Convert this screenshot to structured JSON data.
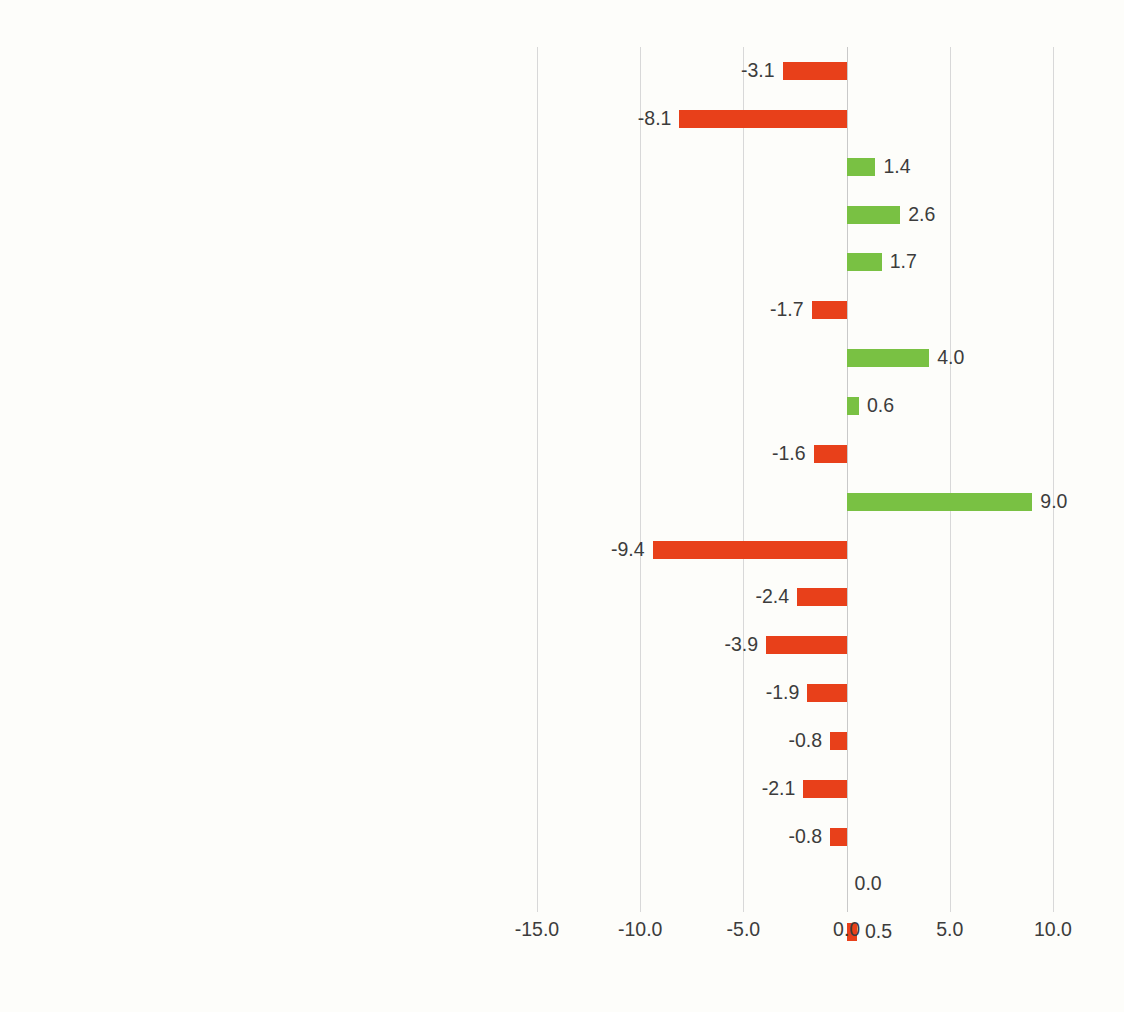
{
  "chart_data": {
    "type": "bar",
    "orientation": "horizontal",
    "title": "",
    "xlabel": "",
    "ylabel": "",
    "xlim": [
      -15.0,
      10.0
    ],
    "xticks": [
      "-15.0",
      "-10.0",
      "-5.0",
      "0.0",
      "5.0",
      "10.0"
    ],
    "xtick_values": [
      -15.0,
      -10.0,
      -5.0,
      0.0,
      5.0,
      10.0
    ],
    "grid": true,
    "legend": "none",
    "colors": {
      "positive": "#79c143",
      "negative": "#e8401a",
      "gridline": "#d8d8d8",
      "text": "#3c3c3c",
      "background": "#fdfdfa"
    },
    "categories": [
      "Other service activities",
      "Arts, entertainment and recreation",
      "Health and social work",
      "Education",
      "Public administration",
      "Administrative and support service activities",
      "Professional, scientific and technical activities",
      "Real estate activities",
      "Financial and insurance",
      "Information and communication",
      "Accommodation and food",
      "Transportation and storage",
      "Wholesale and retail",
      "Construction",
      "Water supply, seweragea and waste",
      "Electricity, gas, steam and air conditioning supply",
      "Manufacturing",
      "Mining and quarrying",
      "Agriculture"
    ],
    "values": [
      -3.1,
      -8.1,
      1.4,
      2.6,
      1.7,
      -1.7,
      4.0,
      0.6,
      -1.6,
      9.0,
      -9.4,
      -2.4,
      -3.9,
      -1.9,
      -0.8,
      -2.1,
      -0.8,
      0.0,
      0.5
    ],
    "labels": [
      "-3.1",
      "-8.1",
      "1.4",
      "2.6",
      "1.7",
      "-1.7",
      "4.0",
      "0.6",
      "-1.6",
      "9.0",
      "-9.4",
      "-2.4",
      "-3.9",
      "-1.9",
      "-0.8",
      "-2.1",
      "-0.8",
      "0.0",
      "0.5"
    ],
    "bar_colors": [
      "#e8401a",
      "#e8401a",
      "#79c143",
      "#79c143",
      "#79c143",
      "#e8401a",
      "#79c143",
      "#79c143",
      "#e8401a",
      "#79c143",
      "#e8401a",
      "#e8401a",
      "#e8401a",
      "#e8401a",
      "#e8401a",
      "#e8401a",
      "#e8401a",
      "none",
      "#e8401a"
    ]
  }
}
